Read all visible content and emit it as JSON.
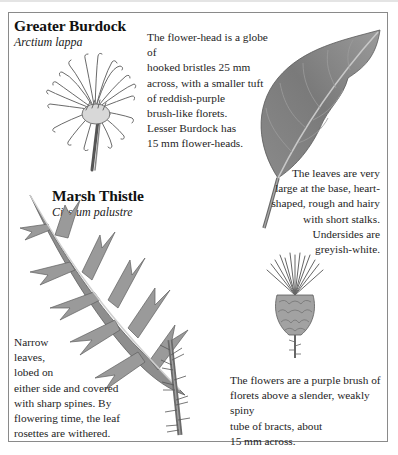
{
  "species": [
    {
      "common_name": "Greater Burdock",
      "latin_name": "Arctium lappa",
      "captions": {
        "flower": "The flower-head is a globe of hooked bristles 25 mm across, with a smaller tuft of reddish-purple brush-like florets. Lesser Burdock has 15 mm flower-heads.",
        "flower_lines": [
          "The flower-head is a globe of",
          "hooked bristles 25 mm",
          "across, with a smaller tuft",
          "of reddish-purple",
          "brush-like florets.",
          "Lesser Burdock has",
          "15 mm flower-heads."
        ],
        "leaf_lines": [
          "The leaves are very",
          "large at the base, heart-",
          "shaped, rough and hairy",
          "with short stalks.",
          "Undersides are",
          "greyish-white."
        ]
      },
      "illustrations": [
        "burdock-flower-head",
        "burdock-leaf"
      ]
    },
    {
      "common_name": "Marsh Thistle",
      "latin_name": "Cirsium palustre",
      "captions": {
        "leaf_lines": [
          "Narrow",
          "leaves,",
          "lobed on",
          "either side and covered",
          "with sharp spines. By",
          "flowering time, the leaf",
          "rosettes are withered."
        ],
        "flower_lines": [
          "The flowers are a purple brush of",
          "florets above a slender, weakly spiny",
          "tube of bracts, about",
          "15 mm across."
        ]
      },
      "illustrations": [
        "thistle-leaf-and-stem",
        "thistle-flower-head"
      ]
    }
  ],
  "colors": {
    "frame": "#8a8a8a",
    "text": "#1e1e1e",
    "leaf": "#7d7d7d",
    "background": "#ffffff"
  }
}
